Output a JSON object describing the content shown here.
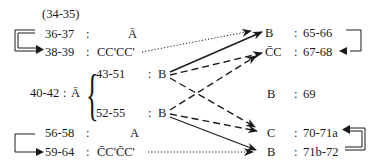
{
  "left": {
    "header": "(34-35)",
    "rows": [
      {
        "range": "36-37",
        "sep": ":",
        "label": "Ā"
      },
      {
        "range": "38-39",
        "sep": ":",
        "label": "CC'CC'"
      },
      {
        "range": "40-42",
        "sep": ":",
        "label": "Ā"
      },
      {
        "range": "56-58",
        "sep": ":",
        "label": "A"
      },
      {
        "range": "59-64",
        "sep": ":",
        "label": "C̄C'C̄C'"
      }
    ],
    "sub": [
      {
        "range": "43-51",
        "sep": ":",
        "label": "B"
      },
      {
        "range": "52-55",
        "sep": ":",
        "label": "B"
      }
    ]
  },
  "right": {
    "rows": [
      {
        "label": "B",
        "sep": ":",
        "range": "65-66"
      },
      {
        "label": "C̄C",
        "sep": ":",
        "range": "67-68"
      },
      {
        "label": "B",
        "sep": ":",
        "range": "69"
      },
      {
        "label": "C",
        "sep": ":",
        "range": "70-71a"
      },
      {
        "label": "B",
        "sep": ":",
        "range": "71b-72"
      }
    ]
  },
  "connections": [
    {
      "from": "38-39",
      "to": "65-66",
      "style": "dotted"
    },
    {
      "from": "43-51",
      "to": "65-66",
      "style": "solid"
    },
    {
      "from": "43-51",
      "to": "67-68",
      "style": "dashed"
    },
    {
      "from": "43-51",
      "to": "70-71a",
      "style": "dashed"
    },
    {
      "from": "52-55",
      "to": "67-68",
      "style": "dashed"
    },
    {
      "from": "52-55",
      "to": "70-71a",
      "style": "dashed"
    },
    {
      "from": "52-55",
      "to": "71b-72",
      "style": "solid"
    },
    {
      "from": "59-64",
      "to": "71b-72",
      "style": "dotted"
    }
  ]
}
